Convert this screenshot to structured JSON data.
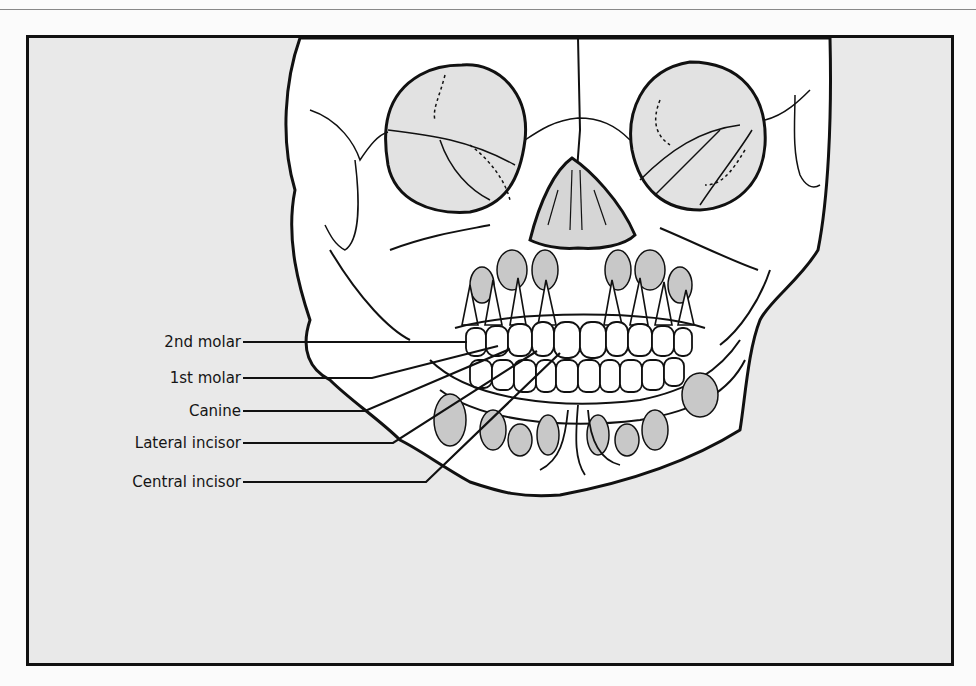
{
  "figure": {
    "background_color": "#e9e9e9",
    "outline_color": "#111111",
    "unerupted_teeth_color": "#c8c8c8"
  },
  "labels": [
    {
      "text": "2nd molar"
    },
    {
      "text": "1st molar"
    },
    {
      "text": "Canine"
    },
    {
      "text": "Lateral incisor"
    },
    {
      "text": "Central incisor"
    }
  ]
}
